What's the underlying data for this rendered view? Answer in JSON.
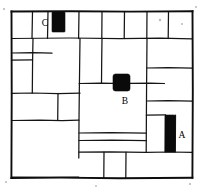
{
  "figure": {
    "background_color": "#ffffff",
    "line_color": "#151515",
    "block_fill_color": "#0a0a0a",
    "frame": {
      "x": 11,
      "y": 11,
      "width": 182,
      "height": 167
    }
  },
  "labels": [
    {
      "id": "label-a",
      "text": "A",
      "x": 182,
      "y": 138,
      "refers_to": "dark-block-a"
    },
    {
      "id": "label-b",
      "text": "B",
      "x": 125,
      "y": 104,
      "refers_to": "dark-block-b"
    },
    {
      "id": "label-c",
      "text": "C",
      "x": 45,
      "y": 26,
      "refers_to": "dark-block-c"
    }
  ],
  "dark_blocks": [
    {
      "id": "dark-block-a",
      "label": "A",
      "shape": "vertical-bar",
      "x": 165,
      "y": 115,
      "width": 10,
      "height": 37
    },
    {
      "id": "dark-block-b",
      "label": "B",
      "shape": "square",
      "x": 113,
      "y": 74,
      "width": 17,
      "height": 17
    },
    {
      "id": "dark-block-c",
      "label": "C",
      "shape": "vertical-rect",
      "x": 52,
      "y": 12,
      "width": 13,
      "height": 20
    }
  ],
  "mortar_paths": [
    "M 11.5 38.5 L 70 38.0 L 120 38.6 L 160 38.2 L 192.5 38.8",
    "M 32.5 11.5 L 32.0 38.5",
    "M 48.0 11.5 L 47.5 38.4",
    "M 79.0 11.6 L 78.6 38.5",
    "M 102.0 11.6 L 101.8 38.4",
    "M 124.5 11.6 L 124.2 38.5",
    "M 147.0 11.6 L 146.8 38.4",
    "M 168.5 11.6 L 168.2 38.5",
    "M 11.5 53.0 L 33.0 52.6 L 52.0 53.2",
    "M 33.0 38.4 L 32.6 60.0 L 32.3 93.0",
    "M 11.5 60.2 L 32.6 59.8",
    "M 11.5 93.4 L 32.3 93.0 L 58.0 93.6 L 80.0 93.2",
    "M 80.0 38.5 L 79.6 70.0 L 79.3 93.2 L 79.0 120.0 L 78.8 158.0",
    "M 11.5 120.5 L 40.0 120.1 L 62.0 120.6 L 78.9 120.2",
    "M 58.0 93.3 L 57.7 120.4",
    "M 79.1 83.5 L 100.0 83.2 L 113.0 83.4",
    "M 130.0 83.4 L 150.0 83.1 L 164.5 83.5",
    "M 102.0 38.4 L 101.7 60.0 L 101.5 83.3",
    "M 147.0 38.4 L 146.8 62.0 L 146.6 83.3 L 146.4 115.0 L 146.2 152.0",
    "M 146.7 68.0 L 168.0 67.7 L 192.5 68.2",
    "M 146.6 101.0 L 168.0 100.7 L 192.5 101.2",
    "M 79.0 133.0 L 110.0 132.6 L 146.3 133.2",
    "M 79.0 140.5 L 112.0 140.1 L 146.3 140.6",
    "M 78.9 152.2 L 110.0 151.8 L 146.2 152.3 L 170.0 152.0 L 192.5 152.4",
    "M 104.0 152.2 L 103.8 177.8",
    "M 126.0 152.2 L 125.8 177.8",
    "M 165.5 115.2 L 165.2 152.1",
    "M 146.4 115.2 L 165.5 114.9",
    "M 175.5 115.1 L 175.3 152.0",
    "M 11.5 177.0 L 50.0 177.4 L 78.8 177.2"
  ],
  "specks": [
    {
      "x": 4,
      "y": 9,
      "r": 1.1
    },
    {
      "x": 196,
      "y": 7,
      "r": 1.0
    },
    {
      "x": 160,
      "y": 20,
      "r": 1.2
    },
    {
      "x": 182,
      "y": 24,
      "r": 1.0
    },
    {
      "x": 6,
      "y": 182,
      "r": 1.0
    },
    {
      "x": 190,
      "y": 184,
      "r": 1.1
    },
    {
      "x": 96,
      "y": 186,
      "r": 0.9
    }
  ]
}
